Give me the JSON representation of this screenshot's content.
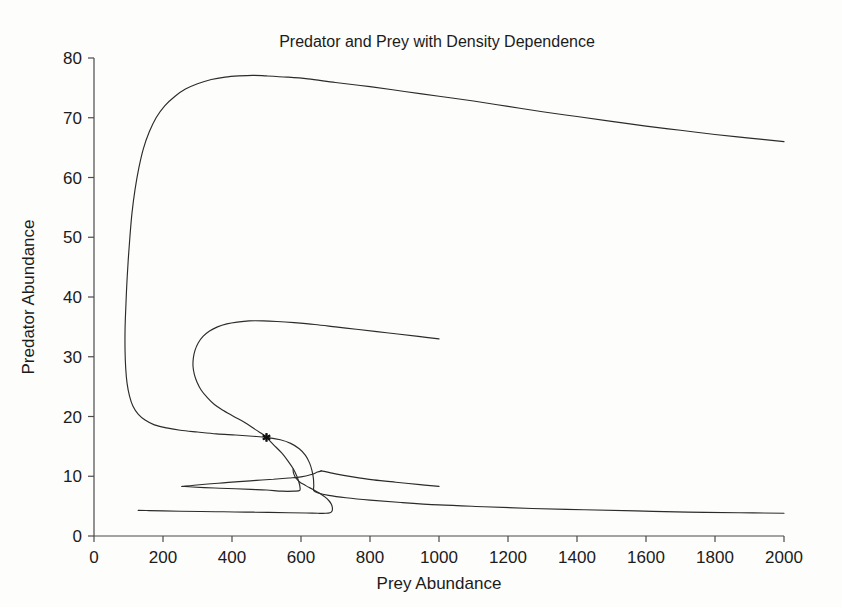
{
  "chart_data": {
    "type": "line",
    "title": "Predator and Prey with Density Dependence",
    "xlabel": "Prey Abundance",
    "ylabel": "Predator Abundance",
    "xlim": [
      0,
      2000
    ],
    "ylim": [
      0,
      80
    ],
    "xticks": [
      0,
      200,
      400,
      600,
      800,
      1000,
      1200,
      1400,
      1600,
      1800,
      2000
    ],
    "yticks": [
      0,
      10,
      20,
      30,
      40,
      50,
      60,
      70,
      80
    ],
    "xtick_labels": [
      "0",
      "200",
      "400",
      "600",
      "800",
      "1000",
      "1200",
      "1400",
      "1600",
      "1800",
      "2000"
    ],
    "ytick_labels": [
      "0",
      "10",
      "20",
      "30",
      "40",
      "50",
      "60",
      "70",
      "80"
    ],
    "grid": false,
    "legend": "none",
    "line_color": "#2b2b2b",
    "background_color": "#fdfdfc",
    "axis_color": "#4a4a4a",
    "annotations": [
      {
        "name": "equilibrium-point",
        "marker": "asterisk",
        "x": 500,
        "y": 16.5,
        "color": "#111111"
      }
    ],
    "series": [
      {
        "name": "Trajectory 1 (outer inward spiral)",
        "points": [
          [
            2000,
            66.0
          ],
          [
            1900,
            66.6
          ],
          [
            1800,
            67.2
          ],
          [
            1700,
            67.9
          ],
          [
            1600,
            68.6
          ],
          [
            1500,
            69.4
          ],
          [
            1400,
            70.2
          ],
          [
            1300,
            71.0
          ],
          [
            1200,
            71.9
          ],
          [
            1100,
            72.8
          ],
          [
            1000,
            73.6
          ],
          [
            900,
            74.4
          ],
          [
            800,
            75.2
          ],
          [
            700,
            75.9
          ],
          [
            620,
            76.5
          ],
          [
            560,
            76.8
          ],
          [
            500,
            77.0
          ],
          [
            460,
            77.1
          ],
          [
            420,
            77.0
          ],
          [
            380,
            76.8
          ],
          [
            340,
            76.4
          ],
          [
            300,
            75.7
          ],
          [
            265,
            74.8
          ],
          [
            235,
            73.6
          ],
          [
            205,
            72.0
          ],
          [
            180,
            70.0
          ],
          [
            160,
            67.6
          ],
          [
            143,
            64.8
          ],
          [
            130,
            61.6
          ],
          [
            119,
            58.0
          ],
          [
            110,
            54.0
          ],
          [
            104,
            50.0
          ],
          [
            99,
            46.0
          ],
          [
            95,
            42.0
          ],
          [
            92,
            38.0
          ],
          [
            90,
            34.5
          ],
          [
            90,
            31.0
          ],
          [
            92,
            28.0
          ],
          [
            96,
            25.5
          ],
          [
            103,
            23.4
          ],
          [
            113,
            21.7
          ],
          [
            128,
            20.4
          ],
          [
            148,
            19.4
          ],
          [
            175,
            18.6
          ],
          [
            210,
            18.1
          ],
          [
            250,
            17.7
          ],
          [
            300,
            17.4
          ],
          [
            355,
            17.1
          ],
          [
            410,
            16.9
          ],
          [
            460,
            16.7
          ],
          [
            500,
            16.5
          ],
          [
            540,
            16.1
          ],
          [
            570,
            15.5
          ],
          [
            595,
            14.6
          ],
          [
            613,
            13.5
          ],
          [
            625,
            12.2
          ],
          [
            632,
            10.9
          ],
          [
            636,
            9.6
          ],
          [
            637,
            8.4
          ],
          [
            637,
            7.6
          ],
          [
            650,
            7.2
          ],
          [
            680,
            6.8
          ],
          [
            730,
            6.4
          ],
          [
            800,
            6.0
          ],
          [
            890,
            5.6
          ],
          [
            1000,
            5.2
          ],
          [
            1130,
            4.9
          ],
          [
            1270,
            4.6
          ],
          [
            1420,
            4.4
          ],
          [
            1570,
            4.2
          ],
          [
            1720,
            4.0
          ],
          [
            1870,
            3.9
          ],
          [
            2000,
            3.8
          ]
        ]
      },
      {
        "name": "Trajectory 2 (inner inward spiral)",
        "points": [
          [
            1000,
            33.0
          ],
          [
            940,
            33.4
          ],
          [
            880,
            33.8
          ],
          [
            820,
            34.2
          ],
          [
            760,
            34.6
          ],
          [
            700,
            35.0
          ],
          [
            640,
            35.4
          ],
          [
            580,
            35.7
          ],
          [
            530,
            35.9
          ],
          [
            490,
            36.0
          ],
          [
            450,
            36.0
          ],
          [
            415,
            35.8
          ],
          [
            385,
            35.5
          ],
          [
            358,
            35.0
          ],
          [
            335,
            34.3
          ],
          [
            316,
            33.4
          ],
          [
            302,
            32.3
          ],
          [
            293,
            31.1
          ],
          [
            288,
            29.8
          ],
          [
            287,
            28.4
          ],
          [
            291,
            27.0
          ],
          [
            299,
            25.7
          ],
          [
            311,
            24.4
          ],
          [
            328,
            23.2
          ],
          [
            349,
            22.0
          ],
          [
            375,
            21.0
          ],
          [
            405,
            20.0
          ],
          [
            437,
            19.0
          ],
          [
            468,
            17.8
          ],
          [
            490,
            17.0
          ],
          [
            500,
            16.5
          ],
          [
            520,
            15.3
          ],
          [
            544,
            13.9
          ],
          [
            563,
            12.5
          ],
          [
            578,
            11.2
          ],
          [
            588,
            10.0
          ],
          [
            594,
            9.0
          ],
          [
            597,
            8.2
          ],
          [
            596,
            7.6
          ],
          [
            580,
            7.5
          ],
          [
            545,
            7.5
          ],
          [
            500,
            7.7
          ],
          [
            455,
            7.8
          ],
          [
            410,
            7.9
          ],
          [
            365,
            8.0
          ],
          [
            320,
            8.1
          ],
          [
            285,
            8.2
          ],
          [
            258,
            8.3
          ],
          [
            258,
            8.3
          ],
          [
            290,
            8.5
          ],
          [
            330,
            8.7
          ],
          [
            375,
            8.9
          ],
          [
            420,
            9.1
          ],
          [
            470,
            9.3
          ],
          [
            520,
            9.5
          ],
          [
            565,
            9.7
          ],
          [
            600,
            9.9
          ],
          [
            630,
            10.3
          ],
          [
            648,
            10.7
          ],
          [
            660,
            10.9
          ],
          [
            660,
            10.9
          ],
          [
            700,
            10.4
          ],
          [
            750,
            9.9
          ],
          [
            810,
            9.4
          ],
          [
            875,
            9.0
          ],
          [
            945,
            8.6
          ],
          [
            1000,
            8.3
          ]
        ]
      },
      {
        "name": "Trajectory 3 (lowest inward arc)",
        "points": [
          [
            128,
            4.3
          ],
          [
            160,
            4.25
          ],
          [
            200,
            4.2
          ],
          [
            250,
            4.15
          ],
          [
            310,
            4.1
          ],
          [
            375,
            4.05
          ],
          [
            440,
            4.0
          ],
          [
            505,
            3.95
          ],
          [
            565,
            3.9
          ],
          [
            615,
            3.85
          ],
          [
            650,
            3.8
          ],
          [
            672,
            3.8
          ],
          [
            684,
            3.9
          ],
          [
            690,
            4.2
          ],
          [
            691,
            4.7
          ],
          [
            688,
            5.3
          ],
          [
            681,
            5.9
          ],
          [
            670,
            6.5
          ],
          [
            655,
            7.1
          ],
          [
            640,
            7.6
          ],
          [
            624,
            8.1
          ],
          [
            609,
            8.6
          ],
          [
            597,
            9.0
          ],
          [
            588,
            9.5
          ],
          [
            582,
            10.0
          ],
          [
            578,
            10.6
          ],
          [
            577,
            11.2
          ]
        ]
      }
    ]
  },
  "figure": {
    "title": "Predator and Prey with Density Dependence",
    "x_axis_title": "Prey Abundance",
    "y_axis_title": "Predator Abundance"
  }
}
